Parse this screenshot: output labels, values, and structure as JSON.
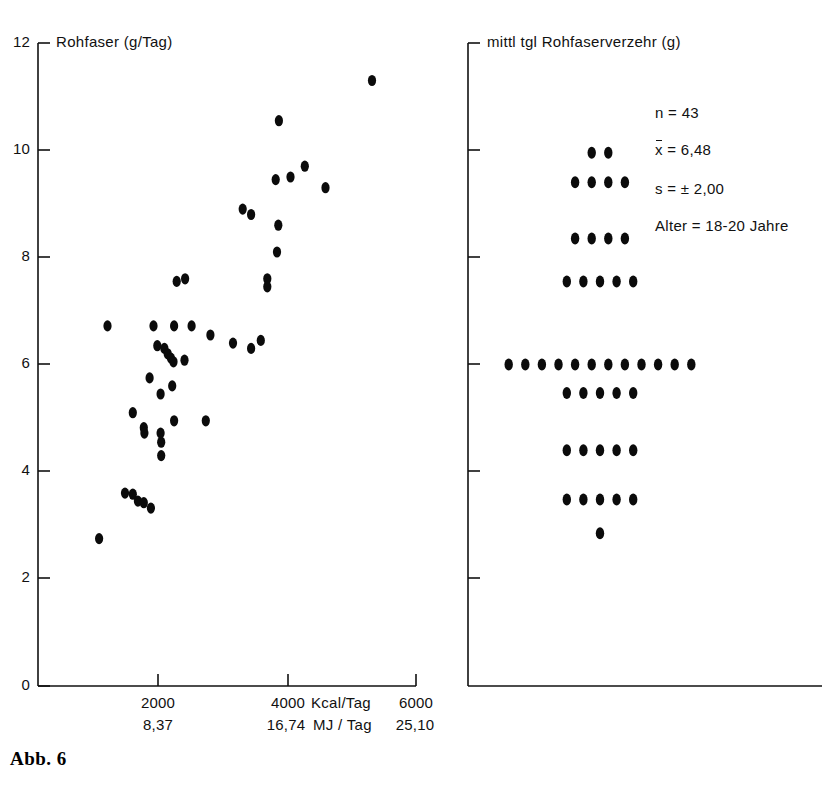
{
  "figure": {
    "caption": "Abb. 6"
  },
  "chart_data": [
    {
      "id": "scatter-panel",
      "type": "scatter",
      "title": "Rohfaser (g/Tag)",
      "xlabel_primary": "Kcal/Tag",
      "xlabel_secondary": "MJ / Tag",
      "ylabel": "Rohfaser (g/Tag)",
      "xlim": [
        0,
        6000
      ],
      "ylim": [
        0,
        12
      ],
      "grid": false,
      "legend": "none",
      "yticks": [
        0,
        2,
        4,
        6,
        8,
        10,
        12
      ],
      "ytick_labels": [
        "0",
        "2",
        "4",
        "6",
        "8",
        "10",
        "12"
      ],
      "xticks_primary": [
        2000,
        4000,
        6000
      ],
      "xtick_labels_primary": [
        "2000",
        "4000",
        "6000"
      ],
      "xticks_secondary": [
        2000,
        4000,
        6000
      ],
      "xtick_labels_secondary": [
        "8,37",
        "16,74",
        "25,10"
      ],
      "points": [
        [
          1100,
          2.75
        ],
        [
          1500,
          3.6
        ],
        [
          1620,
          3.58
        ],
        [
          1700,
          3.45
        ],
        [
          1790,
          3.42
        ],
        [
          1900,
          3.32
        ],
        [
          1790,
          4.82
        ],
        [
          1800,
          4.72
        ],
        [
          1620,
          5.1
        ],
        [
          2060,
          4.3
        ],
        [
          2060,
          4.55
        ],
        [
          2050,
          4.72
        ],
        [
          2050,
          5.45
        ],
        [
          2230,
          5.6
        ],
        [
          1880,
          5.75
        ],
        [
          2260,
          4.95
        ],
        [
          2750,
          4.95
        ],
        [
          1230,
          6.72
        ],
        [
          1940,
          6.72
        ],
        [
          2260,
          6.72
        ],
        [
          2530,
          6.72
        ],
        [
          2000,
          6.35
        ],
        [
          2110,
          6.3
        ],
        [
          2160,
          6.2
        ],
        [
          2210,
          6.12
        ],
        [
          2250,
          6.05
        ],
        [
          2420,
          6.08
        ],
        [
          2820,
          6.55
        ],
        [
          3170,
          6.4
        ],
        [
          3600,
          6.45
        ],
        [
          3450,
          6.3
        ],
        [
          2300,
          7.55
        ],
        [
          2430,
          7.6
        ],
        [
          3320,
          8.9
        ],
        [
          3450,
          8.8
        ],
        [
          3870,
          8.6
        ],
        [
          3850,
          8.1
        ],
        [
          3700,
          7.6
        ],
        [
          3700,
          7.45
        ],
        [
          3830,
          9.45
        ],
        [
          3880,
          10.55
        ],
        [
          4280,
          9.7
        ],
        [
          4060,
          9.5
        ],
        [
          4600,
          9.3
        ],
        [
          5320,
          11.3
        ]
      ]
    },
    {
      "id": "dotplot-panel",
      "type": "dotplot",
      "title": "mittl tgl Rohfaserverzehr (g)",
      "ylabel": "mittl tgl Rohfaserverzehr (g)",
      "ylim": [
        0,
        12
      ],
      "grid": false,
      "legend": "none",
      "yticks": [
        2,
        4,
        6,
        8,
        10,
        12
      ],
      "rows": [
        {
          "value": 9.95,
          "count": 2
        },
        {
          "value": 9.4,
          "count": 4
        },
        {
          "value": 8.35,
          "count": 4
        },
        {
          "value": 7.55,
          "count": 5
        },
        {
          "value": 6.0,
          "count": 12
        },
        {
          "value": 5.47,
          "count": 5
        },
        {
          "value": 4.4,
          "count": 5
        },
        {
          "value": 3.48,
          "count": 5
        },
        {
          "value": 2.85,
          "count": 1
        }
      ],
      "stats": {
        "n_label": "n = 43",
        "mean_prefix": "x",
        "mean_label": " = 6,48",
        "sd_label": "s = ± 2,00",
        "age_label": "Alter = 18-20 Jahre"
      }
    }
  ]
}
